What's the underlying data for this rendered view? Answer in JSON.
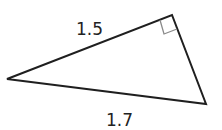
{
  "diagram": {
    "type": "right-triangle",
    "colors": {
      "stroke": "#1f1f1f",
      "right_angle_mark": "#8a8a8a",
      "text": "#222222",
      "background": "#ffffff"
    },
    "labels": {
      "side_top": "1.5",
      "side_bottom": "1.7"
    },
    "right_angle_at": "top vertex"
  }
}
